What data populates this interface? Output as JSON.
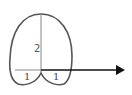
{
  "diagram": {
    "type": "geometric-figure",
    "labels": {
      "height": "2",
      "left_base": "1",
      "right_base": "1"
    },
    "colors": {
      "outline": "#555555",
      "axis_line": "#888888",
      "arrow": "#111111"
    }
  }
}
